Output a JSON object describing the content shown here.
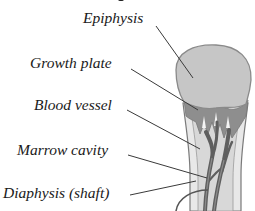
{
  "diagram": {
    "labels": [
      {
        "id": "epiphysis",
        "text": "Epiphysis"
      },
      {
        "id": "growth-plate",
        "text": "Growth plate"
      },
      {
        "id": "blood-vessel",
        "text": "Blood vessel"
      },
      {
        "id": "marrow-cavity",
        "text": "Marrow cavity"
      },
      {
        "id": "diaphysis",
        "text": "Diaphysis (shaft)"
      }
    ],
    "colors": {
      "epiphysis": "#c4c4c4",
      "growth_plate": "#8e8e8e",
      "cortex": "#e6e6e6",
      "marrow": "#dadada",
      "vessel": "#6a6a6a",
      "outline": "#7a7a7a",
      "leader": "#3a3a3a"
    }
  }
}
